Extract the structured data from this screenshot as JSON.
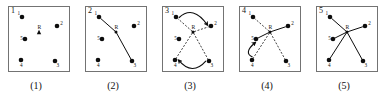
{
  "figure": {
    "panel_count": 5,
    "colors": {
      "border": "#737373",
      "ink": "#0d0d0d",
      "background": "#ffffff"
    },
    "robot_label": "R",
    "node_labels": [
      "1",
      "2",
      "3",
      "4",
      "5"
    ],
    "node_positions": [
      {
        "id": "1",
        "x": 14,
        "y": 11,
        "label_dx": -4.5,
        "label_dy": -2.0
      },
      {
        "id": "2",
        "x": 49,
        "y": 20,
        "label_dx": 3.2,
        "label_dy": -1.5
      },
      {
        "id": "3",
        "x": 47,
        "y": 55,
        "label_dx": 1.5,
        "label_dy": 6.0
      },
      {
        "id": "4",
        "x": 13,
        "y": 54,
        "label_dx": -1.0,
        "label_dy": 6.5
      },
      {
        "id": "5",
        "x": 17,
        "y": 33,
        "label_dx": -4.8,
        "label_dy": 1.2
      }
    ],
    "robot_position": {
      "x": 31,
      "y": 26
    },
    "panels": [
      {
        "index": "1",
        "caption": "(1)",
        "robot_marker": "triangle",
        "edges": [],
        "arcs": []
      },
      {
        "index": "2",
        "caption": "(2)",
        "robot_marker": "dot",
        "edges": [
          {
            "from": "1",
            "to": "R",
            "style": "solid"
          },
          {
            "from": "R",
            "to": "3",
            "style": "solid"
          }
        ],
        "arcs": []
      },
      {
        "index": "3",
        "caption": "(3)",
        "robot_marker": "dot",
        "edges": [
          {
            "from": "R",
            "to": "1",
            "style": "dashed"
          },
          {
            "from": "R",
            "to": "2",
            "style": "dashed"
          },
          {
            "from": "R",
            "to": "3",
            "style": "dashed"
          },
          {
            "from": "R",
            "to": "4",
            "style": "dashed"
          }
        ],
        "arcs": [
          {
            "from": "1",
            "to": "2",
            "direction": "over-top",
            "arrow": true
          },
          {
            "from": "3",
            "to": "4",
            "direction": "under-bottom",
            "arrow": true
          }
        ]
      },
      {
        "index": "4",
        "caption": "(4)",
        "robot_marker": "dot",
        "edges": [
          {
            "from": "R",
            "to": "1",
            "style": "dashed"
          },
          {
            "from": "R",
            "to": "2",
            "style": "solid"
          },
          {
            "from": "R",
            "to": "3",
            "style": "dashed"
          },
          {
            "from": "R",
            "to": "4",
            "style": "dashed"
          },
          {
            "from": "R",
            "to": "5",
            "style": "solid"
          }
        ],
        "arcs": [
          {
            "from": "4",
            "to": "5",
            "direction": "left-bulge",
            "arrow": true
          }
        ]
      },
      {
        "index": "5",
        "caption": "(5)",
        "robot_marker": "dot",
        "edges": [
          {
            "from": "R",
            "to": "1",
            "style": "solid"
          },
          {
            "from": "R",
            "to": "2",
            "style": "solid"
          },
          {
            "from": "R",
            "to": "3",
            "style": "solid"
          },
          {
            "from": "R",
            "to": "4",
            "style": "solid"
          },
          {
            "from": "R",
            "to": "5",
            "style": "solid"
          }
        ],
        "arcs": []
      }
    ]
  }
}
